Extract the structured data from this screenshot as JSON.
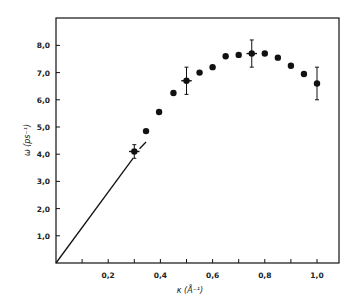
{
  "chart_data": {
    "type": "scatter",
    "title": "",
    "xlabel": "κ (Å⁻¹)",
    "ylabel": "ω (ps⁻¹)",
    "xlim": [
      0,
      1.08
    ],
    "ylim": [
      0,
      8.9
    ],
    "grid": false,
    "legend": null,
    "x_ticks": [
      0.1,
      0.2,
      0.3,
      0.4,
      0.5,
      0.6,
      0.7,
      0.8,
      0.9,
      1.0
    ],
    "x_tick_labels": [
      {
        "value": 0.2,
        "label": "0,2"
      },
      {
        "value": 0.4,
        "label": "0,4"
      },
      {
        "value": 0.6,
        "label": "0,6"
      },
      {
        "value": 0.8,
        "label": "0,8"
      },
      {
        "value": 1.0,
        "label": "1,0"
      }
    ],
    "y_ticks": [
      {
        "value": 1.0,
        "label": "1,0"
      },
      {
        "value": 2.0,
        "label": "2,0"
      },
      {
        "value": 3.0,
        "label": "3,0"
      },
      {
        "value": 4.0,
        "label": "4,0"
      },
      {
        "value": 5.0,
        "label": "5,0"
      },
      {
        "value": 6.0,
        "label": "6,0"
      },
      {
        "value": 7.0,
        "label": "7,0"
      },
      {
        "value": 8.0,
        "label": "8,0"
      }
    ],
    "series": [
      {
        "name": "measured",
        "marker": "filled-circle",
        "x": [
          0.3,
          0.345,
          0.395,
          0.45,
          0.5,
          0.55,
          0.6,
          0.65,
          0.7,
          0.75,
          0.8,
          0.85,
          0.9,
          0.95,
          1.0
        ],
        "y": [
          4.1,
          4.85,
          5.55,
          6.25,
          6.7,
          7.0,
          7.2,
          7.6,
          7.65,
          7.7,
          7.7,
          7.55,
          7.25,
          6.95,
          6.6
        ],
        "error_bars": [
          {
            "x": 0.3,
            "y": 4.1,
            "yerr": 0.25,
            "xerr": 0.02
          },
          {
            "x": 0.5,
            "y": 6.7,
            "yerr": 0.5,
            "xerr": 0.02
          },
          {
            "x": 0.75,
            "y": 7.7,
            "yerr": 0.5,
            "xerr": 0.02
          },
          {
            "x": 1.0,
            "y": 6.6,
            "yerr": 0.6,
            "xerr": 0.01
          }
        ]
      },
      {
        "name": "linear-dispersion",
        "type": "line",
        "x": [
          0.0,
          0.295
        ],
        "y": [
          0.0,
          3.85
        ]
      },
      {
        "name": "linear-dispersion-continuation",
        "type": "line",
        "x": [
          0.32,
          0.345
        ],
        "y": [
          4.2,
          4.45
        ]
      }
    ]
  }
}
